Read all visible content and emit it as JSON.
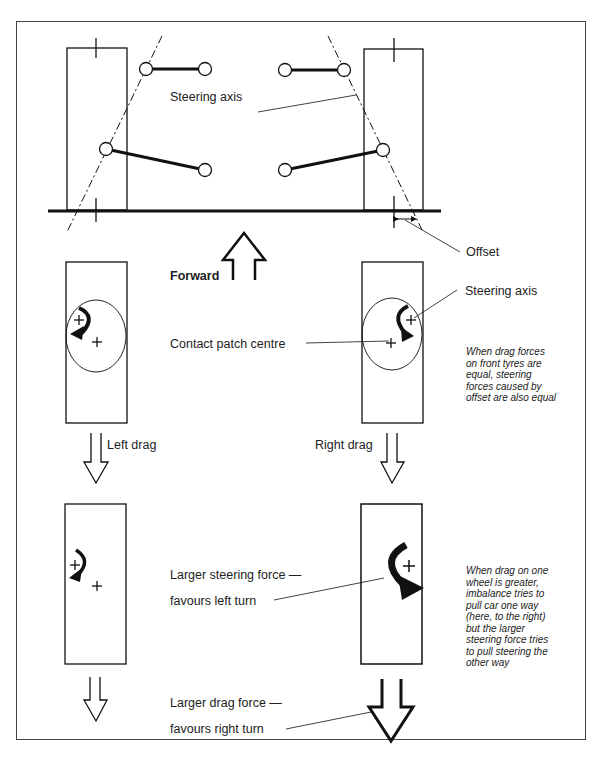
{
  "diagram": {
    "top_section": {
      "steering_axis_label": "Steering axis",
      "offset_label": "Offset",
      "forward_label": "Forward"
    },
    "middle_section": {
      "steering_axis_label": "Steering axis",
      "contact_patch_label": "Contact patch centre",
      "left_drag_label": "Left drag",
      "right_drag_label": "Right drag",
      "note_lines": [
        "When drag forces",
        "on front tyres are",
        "equal, steering",
        "forces caused by",
        "offset are also equal"
      ]
    },
    "bottom_section": {
      "steering_force_line1": "Larger steering force —",
      "steering_force_line2": "favours left turn",
      "drag_force_line1": "Larger drag force —",
      "drag_force_line2": "favours right turn",
      "note_lines": [
        "When drag on one",
        "wheel is greater,",
        "imbalance tries to",
        "pull car one way",
        "(here, to the right)",
        "but the larger",
        "steering force tries",
        "to pull steering the",
        "other way"
      ]
    },
    "icons": [
      "forward-arrow-icon",
      "rotation-arrow-icon",
      "drag-arrow-icon",
      "pivot-cross-icon"
    ],
    "colors": {
      "line": "#111111",
      "background": "#ffffff",
      "frame": "#444444"
    }
  }
}
